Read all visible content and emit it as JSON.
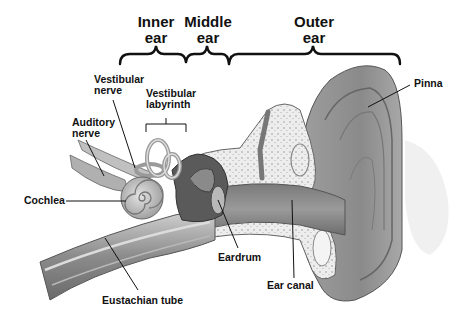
{
  "sections": [
    {
      "id": "inner",
      "line1": "Inner",
      "line2": "ear"
    },
    {
      "id": "middle",
      "line1": "Middle",
      "line2": "ear"
    },
    {
      "id": "outer",
      "line1": "Outer",
      "line2": "ear"
    }
  ],
  "labels": {
    "vestibular_nerve": {
      "line1": "Vestibular",
      "line2": "nerve"
    },
    "vestibular_labyrinth": {
      "line1": "Vestibular",
      "line2": "labyrinth"
    },
    "auditory_nerve": {
      "line1": "Auditory",
      "line2": "nerve"
    },
    "cochlea": "Cochlea",
    "eustachian_tube": "Eustachian tube",
    "eardrum": "Eardrum",
    "ear_canal": "Ear canal",
    "pinna": "Pinna"
  },
  "colors": {
    "background": "#ffffff",
    "text": "#111111",
    "tissue_dark": "#6e6e6e",
    "tissue_mid": "#9a9a9a",
    "tissue_light": "#c8c8c8",
    "bone": "#ececec"
  }
}
